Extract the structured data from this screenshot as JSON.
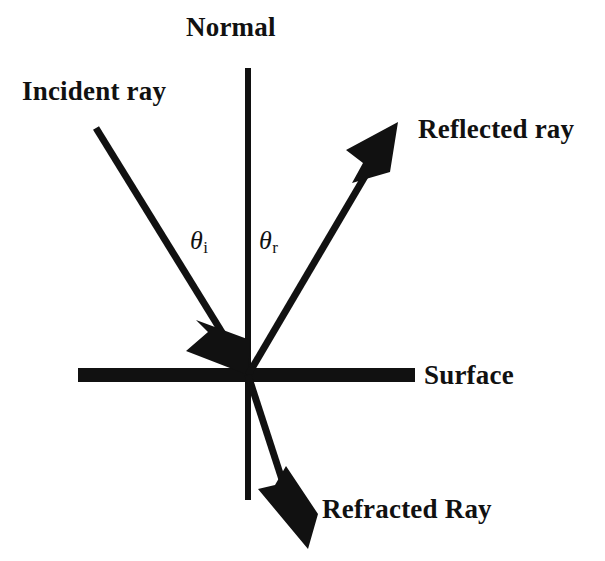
{
  "diagram": {
    "background_color": "#ffffff",
    "stroke_color": "#111111",
    "labels": {
      "normal": "Normal",
      "incident_ray": "Incident ray",
      "reflected_ray": "Reflected ray",
      "surface": "Surface",
      "refracted_ray": "Refracted Ray"
    },
    "angles": {
      "incidence_symbol": "θ",
      "incidence_subscript": "i",
      "reflection_symbol": "θ",
      "reflection_subscript": "r"
    },
    "geometry": {
      "intersection_point": [
        248,
        375
      ],
      "normal_line": {
        "x": 248,
        "y_top": 68,
        "y_bottom": 500,
        "width": 6
      },
      "surface_line": {
        "x_left": 78,
        "x_right": 415,
        "y": 375,
        "thickness": 14
      },
      "incident_ray": {
        "from": [
          96,
          128
        ],
        "to": [
          248,
          375
        ],
        "arrow_at": [
          243,
          366
        ]
      },
      "reflected_ray": {
        "from": [
          248,
          375
        ],
        "to": [
          395,
          125
        ]
      },
      "refracted_ray": {
        "from": [
          248,
          375
        ],
        "to": [
          305,
          545
        ]
      }
    }
  }
}
